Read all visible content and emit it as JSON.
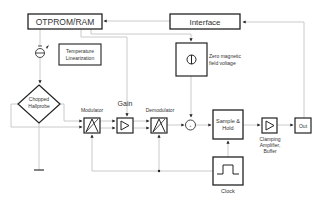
{
  "diagram": {
    "blocks": {
      "otprom": {
        "label": "OTPROM/RAM"
      },
      "interface": {
        "label": "Interface"
      },
      "temp_lin": {
        "line1": "Temperature",
        "line2": "Linearization"
      },
      "zero_field": {
        "line1": "Zero magnetic",
        "line2": "field voltage"
      },
      "hallprobe": {
        "line1": "Chopped",
        "line2": "Hallprobe"
      },
      "modulator": {
        "label": "Modulator"
      },
      "gain": {
        "label": "Gain"
      },
      "demodulator": {
        "label": "Demodulator"
      },
      "sample_hold": {
        "line1": "Sample &",
        "line2": "Hold"
      },
      "clamping": {
        "line1": "Clamping",
        "line2": "Amplifier,",
        "line3": "Buffer"
      },
      "out": {
        "label": "Out"
      },
      "clock": {
        "label": "Clock"
      }
    },
    "colors": {
      "line": "#bbbbbb",
      "box": "#222222",
      "text": "#333333"
    }
  }
}
